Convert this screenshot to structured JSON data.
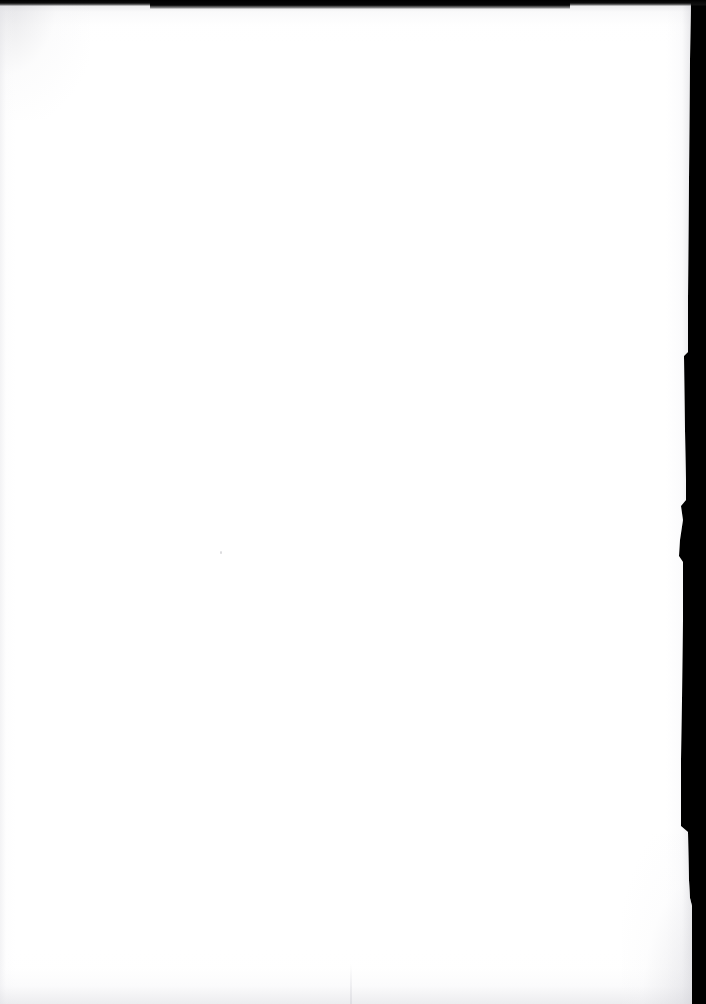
{
  "scan": {
    "width": 706,
    "height": 1004,
    "background_color": "#000000",
    "page_color": "#ffffff",
    "content": "",
    "description": "Blank page"
  },
  "page": {
    "orientation": "portrait",
    "is_blank": true,
    "visible_text": "",
    "left_edge_x": 0,
    "top_edge_y": 0,
    "bottom_edge_y": 1004,
    "right_edge_x_top": 691,
    "right_edge_x_narrowest": 678,
    "right_edge_x_bottom": 692
  },
  "edges": {
    "top_band_color": "#000000",
    "top_band_height": 6,
    "right_margin_color": "#000000",
    "shadow_color": "#d6d6dc"
  },
  "marks": {
    "speck": {
      "x": 220,
      "y": 551
    }
  }
}
